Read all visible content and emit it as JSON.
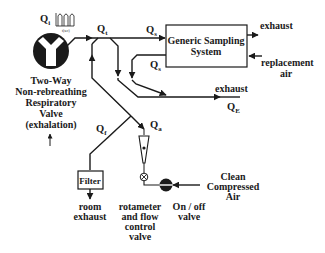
{
  "diagram": {
    "type": "flow-schematic",
    "colors": {
      "ink": "#1a1a1a",
      "background": "#ffffff"
    },
    "flows": {
      "qi": {
        "main": "Q",
        "sub": "i"
      },
      "qi_axis": "t(sec)",
      "qt": {
        "main": "Q",
        "sub": "t"
      },
      "qs_in": {
        "main": "Q",
        "sub": "s"
      },
      "qs_out": {
        "main": "Q",
        "sub": "s"
      },
      "qe": {
        "main": "Q",
        "sub": "E"
      },
      "qf": {
        "main": "Q",
        "sub": "f"
      },
      "qa": {
        "main": "Q",
        "sub": "a"
      }
    },
    "sampling_system": {
      "line1": "Generic Sampling",
      "line2": "System"
    },
    "labels": {
      "exhaust_top": "exhaust",
      "replacement_air": {
        "line1": "replacement",
        "line2": "air"
      },
      "exhaust_mid": "exhaust",
      "valve": {
        "line1": "Two-Way",
        "line2": "Non-rebreathing",
        "line3": "Respiratory",
        "line4": "Valve",
        "line5": "(exhalation)"
      },
      "filter": "Filter",
      "room_exhaust": {
        "line1": "room",
        "line2": "exhaust"
      },
      "rotameter": {
        "line1": "rotameter",
        "line2": "and flow",
        "line3": "control",
        "line4": "valve"
      },
      "onoff": {
        "line1": "On / off",
        "line2": "valve"
      },
      "clean_air": {
        "line1": "Clean",
        "line2": "Compressed",
        "line3": "Air"
      }
    }
  }
}
